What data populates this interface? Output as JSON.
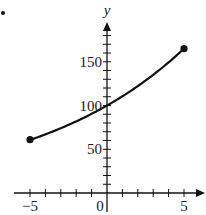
{
  "chart_data": {
    "type": "line",
    "title": "",
    "xlabel": "",
    "ylabel": "y",
    "xlim": [
      -5,
      5
    ],
    "ylim": [
      0,
      170
    ],
    "x_tick_step": 1,
    "y_tick_step": 10,
    "x_tick_labels": [
      {
        "value": -5,
        "text": "−5"
      },
      {
        "value": 0,
        "text": "0"
      },
      {
        "value": 5,
        "text": "5"
      }
    ],
    "y_tick_labels": [
      {
        "value": 50,
        "text": "50"
      },
      {
        "value": 100,
        "text": "100"
      },
      {
        "value": 150,
        "text": "150"
      }
    ],
    "grid": false,
    "series": [
      {
        "name": "curve",
        "description": "increasing exponential-like curve passing through (0, 100)",
        "x": [
          -5,
          -4,
          -3,
          -2,
          -1,
          0,
          1,
          2,
          3,
          4,
          5
        ],
        "y": [
          61,
          67,
          74,
          82,
          90,
          100,
          111,
          122,
          135,
          149,
          165
        ],
        "endpoints": [
          [
            -5,
            61
          ],
          [
            5,
            165
          ]
        ],
        "endpoint_markers": "filled-circle"
      }
    ]
  },
  "page": {
    "bullet": "•"
  }
}
